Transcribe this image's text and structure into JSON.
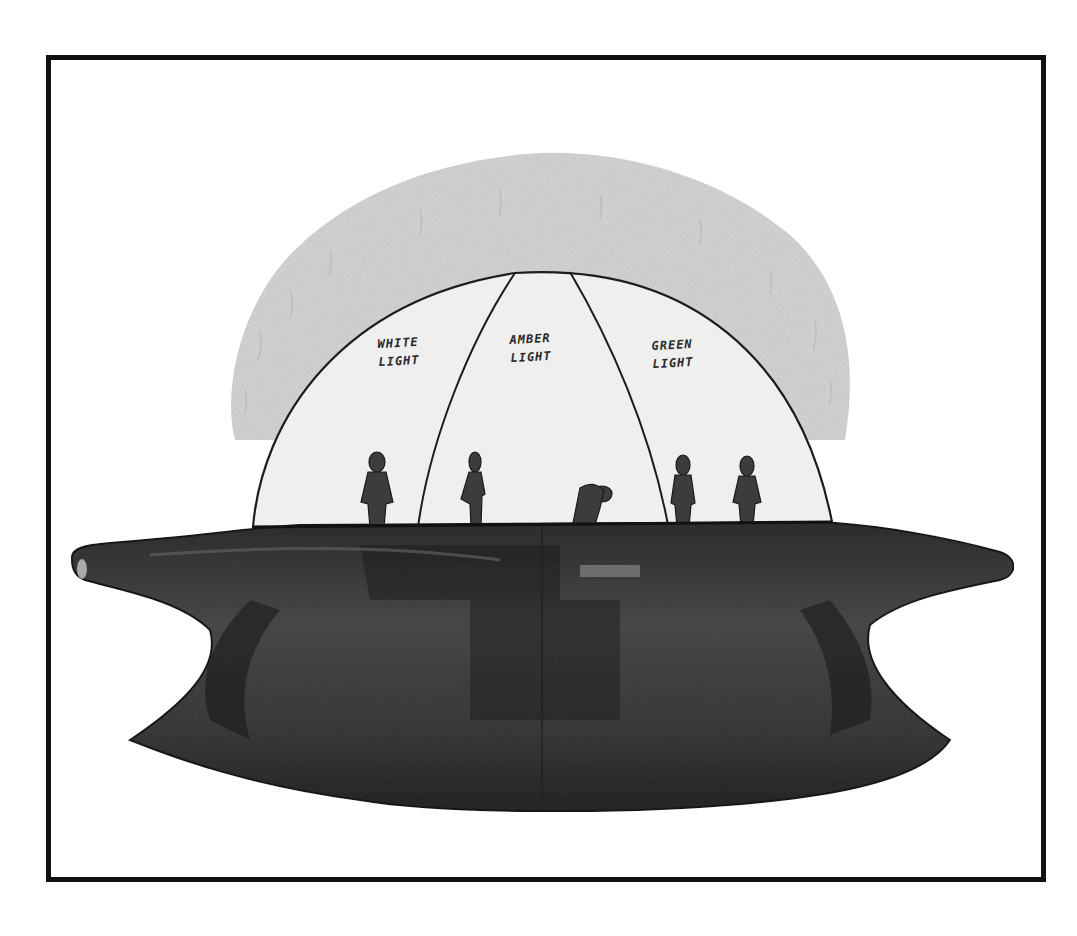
{
  "illustration": {
    "subject": "hand-drawn UFO sketch with transparent dome divided into three lit sections and five figures",
    "frame_color": "#111111",
    "glow_color": "#d9d9d9",
    "hull_color": "#3a3a3a",
    "dome_sections": [
      {
        "line1": "WHITE",
        "line2": "LIGHT"
      },
      {
        "line1": "AMBER",
        "line2": "LIGHT"
      },
      {
        "line1": "GREEN",
        "line2": "LIGHT"
      }
    ],
    "figures_count": 5
  }
}
